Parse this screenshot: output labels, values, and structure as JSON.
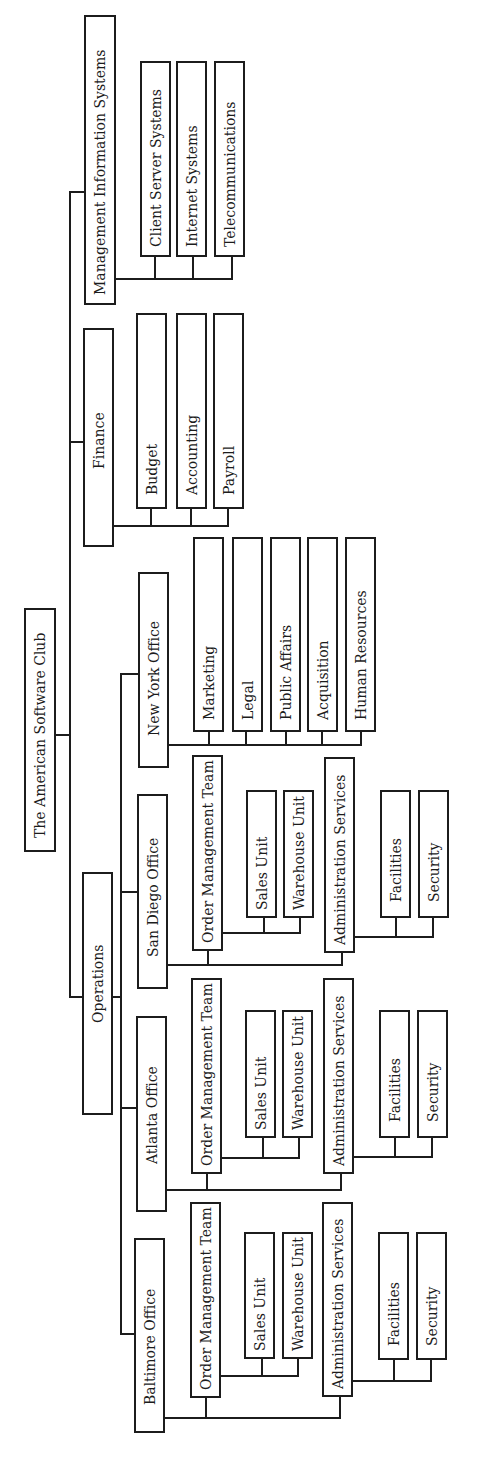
{
  "diagram": {
    "type": "org-chart",
    "orientation": "rotated-90-ccw",
    "stroke_color": "#1c1c1c",
    "background": "#ffffff",
    "root": "The American Software Club",
    "nodes": [
      {
        "id": "root",
        "label": "The American Software Club",
        "x": 24,
        "y": 608,
        "w": 32,
        "h": 244,
        "fs": 14,
        "pad": 12
      },
      {
        "id": "mis",
        "label": "Management Information Systems",
        "x": 84,
        "y": 15,
        "w": 32,
        "h": 290,
        "fs": 14,
        "pad": 8
      },
      {
        "id": "mis-client",
        "label": "Client Server Systems",
        "x": 140,
        "y": 61,
        "w": 31,
        "h": 196,
        "fs": 14,
        "pad": 8
      },
      {
        "id": "mis-internet",
        "label": "Internet Systems",
        "x": 176,
        "y": 61,
        "w": 31,
        "h": 196,
        "fs": 14,
        "pad": 8
      },
      {
        "id": "mis-telecom",
        "label": "Telecommunications",
        "x": 214,
        "y": 61,
        "w": 31,
        "h": 196,
        "fs": 14,
        "pad": 8
      },
      {
        "id": "finance",
        "label": "Finance",
        "x": 83,
        "y": 328,
        "w": 31,
        "h": 219,
        "fs": 14,
        "pad": 76
      },
      {
        "id": "fin-budget",
        "label": "Budget",
        "x": 136,
        "y": 313,
        "w": 31,
        "h": 196,
        "fs": 14,
        "pad": 12
      },
      {
        "id": "fin-accounting",
        "label": "Accounting",
        "x": 176,
        "y": 313,
        "w": 31,
        "h": 196,
        "fs": 14,
        "pad": 12
      },
      {
        "id": "fin-payroll",
        "label": "Payroll",
        "x": 213,
        "y": 313,
        "w": 31,
        "h": 196,
        "fs": 14,
        "pad": 12
      },
      {
        "id": "operations",
        "label": "Operations",
        "x": 82,
        "y": 872,
        "w": 31,
        "h": 243,
        "fs": 14,
        "pad": 90
      },
      {
        "id": "ny",
        "label": "New York Office",
        "x": 138,
        "y": 572,
        "w": 31,
        "h": 196,
        "fs": 14,
        "pad": 30
      },
      {
        "id": "ny-marketing",
        "label": "Marketing",
        "x": 193,
        "y": 537,
        "w": 31,
        "h": 195,
        "fs": 14,
        "pad": 10
      },
      {
        "id": "ny-legal",
        "label": "Legal",
        "x": 232,
        "y": 537,
        "w": 31,
        "h": 195,
        "fs": 14,
        "pad": 10
      },
      {
        "id": "ny-public",
        "label": "Public Affairs",
        "x": 270,
        "y": 537,
        "w": 31,
        "h": 195,
        "fs": 14,
        "pad": 10
      },
      {
        "id": "ny-acquisition",
        "label": "Acquisition",
        "x": 307,
        "y": 537,
        "w": 31,
        "h": 195,
        "fs": 14,
        "pad": 10
      },
      {
        "id": "ny-hr",
        "label": "Human Resources",
        "x": 345,
        "y": 537,
        "w": 31,
        "h": 195,
        "fs": 14,
        "pad": 10
      },
      {
        "id": "sd",
        "label": "San Diego Office",
        "x": 137,
        "y": 794,
        "w": 31,
        "h": 195,
        "fs": 14,
        "pad": 30
      },
      {
        "id": "sd-omt",
        "label": "Order Management Team",
        "x": 192,
        "y": 755,
        "w": 31,
        "h": 196,
        "fs": 14,
        "pad": 6
      },
      {
        "id": "sd-sales",
        "label": "Sales Unit",
        "x": 246,
        "y": 790,
        "w": 31,
        "h": 128,
        "fs": 14,
        "pad": 6
      },
      {
        "id": "sd-warehouse",
        "label": "Warehouse Unit",
        "x": 283,
        "y": 790,
        "w": 31,
        "h": 128,
        "fs": 14,
        "pad": 6
      },
      {
        "id": "sd-admin",
        "label": "Administration Services",
        "x": 324,
        "y": 757,
        "w": 31,
        "h": 196,
        "fs": 14,
        "pad": 6
      },
      {
        "id": "sd-facilities",
        "label": "Facilities",
        "x": 380,
        "y": 790,
        "w": 31,
        "h": 128,
        "fs": 14,
        "pad": 14
      },
      {
        "id": "sd-security",
        "label": "Security",
        "x": 418,
        "y": 790,
        "w": 31,
        "h": 128,
        "fs": 14,
        "pad": 14
      },
      {
        "id": "atl",
        "label": "Atlanta Office",
        "x": 136,
        "y": 1016,
        "w": 31,
        "h": 196,
        "fs": 14,
        "pad": 46
      },
      {
        "id": "atl-omt",
        "label": "Order Management Team",
        "x": 191,
        "y": 978,
        "w": 31,
        "h": 196,
        "fs": 14,
        "pad": 6
      },
      {
        "id": "atl-sales",
        "label": "Sales Unit",
        "x": 245,
        "y": 1010,
        "w": 31,
        "h": 128,
        "fs": 14,
        "pad": 6
      },
      {
        "id": "atl-warehouse",
        "label": "Warehouse Unit",
        "x": 282,
        "y": 1010,
        "w": 31,
        "h": 128,
        "fs": 14,
        "pad": 6
      },
      {
        "id": "atl-admin",
        "label": "Administration Services",
        "x": 323,
        "y": 978,
        "w": 31,
        "h": 196,
        "fs": 14,
        "pad": 6
      },
      {
        "id": "atl-facilities",
        "label": "Facilities",
        "x": 379,
        "y": 1010,
        "w": 31,
        "h": 128,
        "fs": 14,
        "pad": 14
      },
      {
        "id": "atl-security",
        "label": "Security",
        "x": 417,
        "y": 1010,
        "w": 31,
        "h": 128,
        "fs": 14,
        "pad": 14
      },
      {
        "id": "bal",
        "label": "Baltimore Office",
        "x": 134,
        "y": 1238,
        "w": 31,
        "h": 195,
        "fs": 14,
        "pad": 26
      },
      {
        "id": "bal-omt",
        "label": "Order Management Team",
        "x": 190,
        "y": 1202,
        "w": 31,
        "h": 196,
        "fs": 14,
        "pad": 6
      },
      {
        "id": "bal-sales",
        "label": "Sales Unit",
        "x": 244,
        "y": 1232,
        "w": 31,
        "h": 127,
        "fs": 14,
        "pad": 6
      },
      {
        "id": "bal-warehouse",
        "label": "Warehouse Unit",
        "x": 282,
        "y": 1232,
        "w": 31,
        "h": 127,
        "fs": 14,
        "pad": 6
      },
      {
        "id": "bal-admin",
        "label": "Administration Services",
        "x": 322,
        "y": 1202,
        "w": 31,
        "h": 195,
        "fs": 14,
        "pad": 6
      },
      {
        "id": "bal-facilities",
        "label": "Facilities",
        "x": 378,
        "y": 1232,
        "w": 31,
        "h": 128,
        "fs": 14,
        "pad": 12
      },
      {
        "id": "bal-security",
        "label": "Security",
        "x": 416,
        "y": 1232,
        "w": 31,
        "h": 128,
        "fs": 14,
        "pad": 12
      }
    ],
    "lines": [
      {
        "x1": 55,
        "y1": 735,
        "x2": 71,
        "y2": 735
      },
      {
        "x1": 70,
        "y1": 191,
        "x2": 70,
        "y2": 998
      },
      {
        "x1": 70,
        "y1": 192,
        "x2": 84,
        "y2": 192
      },
      {
        "x1": 70,
        "y1": 442,
        "x2": 83,
        "y2": 442
      },
      {
        "x1": 70,
        "y1": 997,
        "x2": 82,
        "y2": 997
      },
      {
        "x1": 115,
        "y1": 279,
        "x2": 233,
        "y2": 279
      },
      {
        "x1": 155,
        "y1": 256,
        "x2": 155,
        "y2": 280
      },
      {
        "x1": 193,
        "y1": 256,
        "x2": 193,
        "y2": 280
      },
      {
        "x1": 232,
        "y1": 256,
        "x2": 232,
        "y2": 280
      },
      {
        "x1": 114,
        "y1": 526,
        "x2": 229,
        "y2": 526
      },
      {
        "x1": 151,
        "y1": 508,
        "x2": 151,
        "y2": 527
      },
      {
        "x1": 191,
        "y1": 508,
        "x2": 191,
        "y2": 527
      },
      {
        "x1": 228,
        "y1": 508,
        "x2": 228,
        "y2": 527
      },
      {
        "x1": 113,
        "y1": 997,
        "x2": 122,
        "y2": 997
      },
      {
        "x1": 121,
        "y1": 673,
        "x2": 121,
        "y2": 1335
      },
      {
        "x1": 121,
        "y1": 674,
        "x2": 138,
        "y2": 674
      },
      {
        "x1": 121,
        "y1": 892,
        "x2": 137,
        "y2": 892
      },
      {
        "x1": 121,
        "y1": 1108,
        "x2": 136,
        "y2": 1108
      },
      {
        "x1": 121,
        "y1": 1334,
        "x2": 134,
        "y2": 1334
      },
      {
        "x1": 168,
        "y1": 745,
        "x2": 362,
        "y2": 745
      },
      {
        "x1": 209,
        "y1": 731,
        "x2": 209,
        "y2": 746
      },
      {
        "x1": 246,
        "y1": 731,
        "x2": 246,
        "y2": 746
      },
      {
        "x1": 286,
        "y1": 731,
        "x2": 286,
        "y2": 746
      },
      {
        "x1": 322,
        "y1": 731,
        "x2": 322,
        "y2": 746
      },
      {
        "x1": 361,
        "y1": 731,
        "x2": 361,
        "y2": 746
      },
      {
        "x1": 167,
        "y1": 965,
        "x2": 343,
        "y2": 965
      },
      {
        "x1": 208,
        "y1": 950,
        "x2": 208,
        "y2": 966
      },
      {
        "x1": 342,
        "y1": 952,
        "x2": 342,
        "y2": 966
      },
      {
        "x1": 222,
        "y1": 933,
        "x2": 301,
        "y2": 933
      },
      {
        "x1": 264,
        "y1": 917,
        "x2": 264,
        "y2": 934
      },
      {
        "x1": 300,
        "y1": 917,
        "x2": 300,
        "y2": 934
      },
      {
        "x1": 355,
        "y1": 937,
        "x2": 434,
        "y2": 937
      },
      {
        "x1": 396,
        "y1": 917,
        "x2": 396,
        "y2": 938
      },
      {
        "x1": 433,
        "y1": 917,
        "x2": 433,
        "y2": 938
      },
      {
        "x1": 166,
        "y1": 1190,
        "x2": 342,
        "y2": 1190
      },
      {
        "x1": 207,
        "y1": 1173,
        "x2": 207,
        "y2": 1191
      },
      {
        "x1": 341,
        "y1": 1173,
        "x2": 341,
        "y2": 1191
      },
      {
        "x1": 221,
        "y1": 1158,
        "x2": 300,
        "y2": 1158
      },
      {
        "x1": 263,
        "y1": 1137,
        "x2": 263,
        "y2": 1159
      },
      {
        "x1": 299,
        "y1": 1137,
        "x2": 299,
        "y2": 1159
      },
      {
        "x1": 353,
        "y1": 1157,
        "x2": 433,
        "y2": 1157
      },
      {
        "x1": 395,
        "y1": 1137,
        "x2": 395,
        "y2": 1158
      },
      {
        "x1": 432,
        "y1": 1137,
        "x2": 432,
        "y2": 1158
      },
      {
        "x1": 165,
        "y1": 1418,
        "x2": 341,
        "y2": 1418
      },
      {
        "x1": 206,
        "y1": 1397,
        "x2": 206,
        "y2": 1419
      },
      {
        "x1": 340,
        "y1": 1396,
        "x2": 340,
        "y2": 1419
      },
      {
        "x1": 221,
        "y1": 1376,
        "x2": 299,
        "y2": 1376
      },
      {
        "x1": 262,
        "y1": 1358,
        "x2": 262,
        "y2": 1377
      },
      {
        "x1": 298,
        "y1": 1358,
        "x2": 298,
        "y2": 1377
      },
      {
        "x1": 352,
        "y1": 1381,
        "x2": 432,
        "y2": 1381
      },
      {
        "x1": 394,
        "y1": 1359,
        "x2": 394,
        "y2": 1382
      },
      {
        "x1": 431,
        "y1": 1359,
        "x2": 431,
        "y2": 1382
      }
    ]
  },
  "hierarchy": {
    "label": "The American Software Club",
    "children": [
      {
        "label": "Operations",
        "children": [
          {
            "label": "New York Office",
            "children": [
              "Marketing",
              "Legal",
              "Public Affairs",
              "Acquisition",
              "Human Resources"
            ]
          },
          {
            "label": "San Diego Office",
            "children": [
              {
                "label": "Order Management Team",
                "children": [
                  "Sales Unit",
                  "Warehouse Unit"
                ]
              },
              {
                "label": "Administration Services",
                "children": [
                  "Facilities",
                  "Security"
                ]
              }
            ]
          },
          {
            "label": "Atlanta Office",
            "children": [
              {
                "label": "Order Management Team",
                "children": [
                  "Sales Unit",
                  "Warehouse Unit"
                ]
              },
              {
                "label": "Administration Services",
                "children": [
                  "Facilities",
                  "Security"
                ]
              }
            ]
          },
          {
            "label": "Baltimore Office",
            "children": [
              {
                "label": "Order Management Team",
                "children": [
                  "Sales Unit",
                  "Warehouse Unit"
                ]
              },
              {
                "label": "Administration Services",
                "children": [
                  "Facilities",
                  "Security"
                ]
              }
            ]
          }
        ]
      },
      {
        "label": "Finance",
        "children": [
          "Budget",
          "Accounting",
          "Payroll"
        ]
      },
      {
        "label": "Management Information Systems",
        "children": [
          "Client Server Systems",
          "Internet Systems",
          "Telecommunications"
        ]
      }
    ]
  }
}
